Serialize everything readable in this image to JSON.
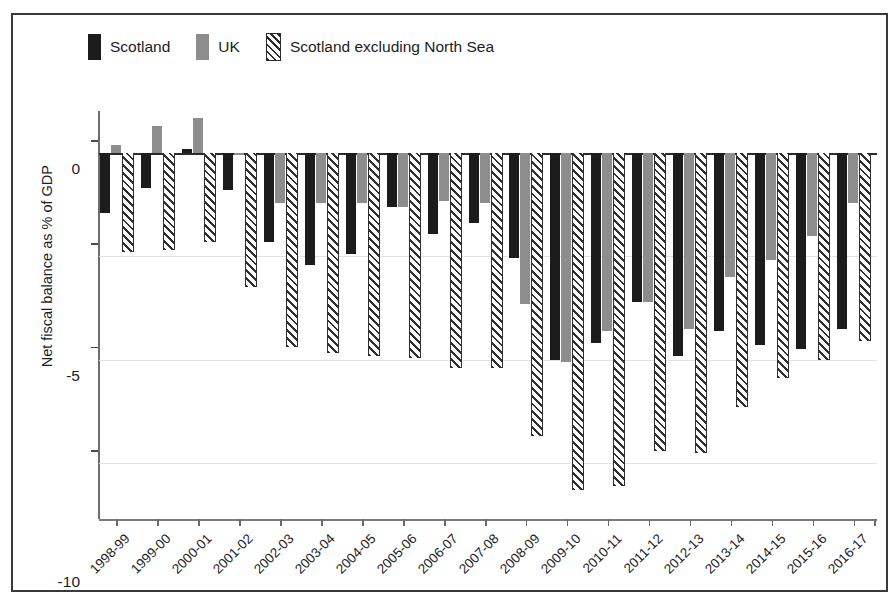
{
  "chart_data": {
    "type": "bar",
    "title": "",
    "xlabel": "",
    "ylabel": "Net fiscal balance as % of GDP",
    "ylim": [
      -17.5,
      2.5
    ],
    "yticks": [
      0,
      -5,
      -10,
      -15
    ],
    "ytick_labels": [
      "0",
      "-5",
      "-10",
      "-15"
    ],
    "grid": true,
    "legend_position": "top-left",
    "categories": [
      "1998-99",
      "1999-00",
      "2000-01",
      "2001-02",
      "2002-03",
      "2003-04",
      "2004-05",
      "2005-06",
      "2006-07",
      "2007-08",
      "2008-09",
      "2009-10",
      "2010-11",
      "2011-12",
      "2012-13",
      "2013-14",
      "2014-15",
      "2015-16",
      "2016-17"
    ],
    "series": [
      {
        "name": "Scotland",
        "color": "#1c1c1c",
        "values": [
          -2.9,
          -1.7,
          0.2,
          -1.8,
          -4.3,
          -5.4,
          -4.9,
          -2.6,
          -3.9,
          -3.4,
          -5.1,
          -10.0,
          -9.2,
          -7.2,
          -9.8,
          -8.6,
          -9.3,
          -9.5,
          -8.5
        ]
      },
      {
        "name": "UK",
        "color": "#8d8d8d",
        "values": [
          0.4,
          1.3,
          1.7,
          -0.1,
          -2.4,
          -2.4,
          -2.4,
          -2.6,
          -2.3,
          -2.4,
          -7.3,
          -10.1,
          -8.6,
          -7.2,
          -8.5,
          -6.0,
          -5.2,
          -4.0,
          -2.4
        ]
      },
      {
        "name": "Scotland excluding North Sea",
        "color": "#ffffff",
        "pattern": "diagonal-hatch",
        "values": [
          -4.8,
          -4.7,
          -4.3,
          -6.5,
          -9.4,
          -9.7,
          -9.8,
          -9.9,
          -10.4,
          -10.4,
          -13.7,
          -16.3,
          -16.1,
          -14.4,
          -14.5,
          -12.3,
          -10.9,
          -10.0,
          -9.1
        ]
      }
    ]
  },
  "legend": {
    "items": [
      {
        "label": "Scotland",
        "swatch": "sw-scotland"
      },
      {
        "label": "UK",
        "swatch": "sw-uk"
      },
      {
        "label": "Scotland excluding North Sea",
        "swatch": "sw-exns"
      }
    ]
  }
}
